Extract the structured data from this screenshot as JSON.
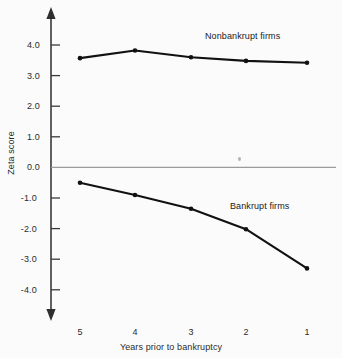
{
  "chart_data": {
    "type": "line",
    "title": "",
    "xlabel": "Years prior to bankruptcy",
    "ylabel": "Zeta score",
    "categories": [
      "5",
      "4",
      "3",
      "2",
      "1"
    ],
    "x": [
      5,
      4,
      3,
      2,
      1
    ],
    "xlim": [
      5.45,
      0.6
    ],
    "ylim": [
      -4.6,
      4.6
    ],
    "yticks": [
      "4.0",
      "3.0",
      "2.0",
      "1.0",
      "0.0",
      "-1.0",
      "-2.0",
      "-3.0",
      "-4.0"
    ],
    "ytick_values": [
      4.0,
      3.0,
      2.0,
      1.0,
      0.0,
      -1.0,
      -2.0,
      -3.0,
      -4.0
    ],
    "grid": false,
    "legend_position": "inline-annotation",
    "zero_line": true,
    "series": [
      {
        "name": "Nonbankrupt firms",
        "values": [
          3.57,
          3.82,
          3.6,
          3.48,
          3.42
        ],
        "color": "#111111",
        "label_x": 205,
        "label_y": 36
      },
      {
        "name": "Bankrupt firms",
        "values": [
          -0.5,
          -0.9,
          -1.35,
          -2.02,
          -3.3
        ],
        "color": "#111111",
        "label_x": 230,
        "label_y": 206
      }
    ],
    "axis_color": "#3a3a3a",
    "zero_line_color": "#9b9b9b",
    "text_color": "#2b2b2b"
  }
}
